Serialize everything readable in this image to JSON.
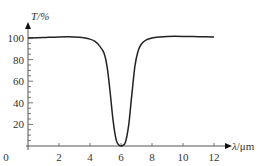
{
  "chart_data": {
    "type": "line",
    "title": "",
    "xlabel": "λ/μm",
    "ylabel": "T/%",
    "xlim": [
      0,
      13
    ],
    "ylim": [
      0,
      110
    ],
    "grid": false,
    "legend": null,
    "x_ticks": [
      0,
      2,
      4,
      6,
      8,
      10,
      12
    ],
    "y_ticks": [
      20,
      40,
      60,
      80,
      100
    ],
    "origin_label": "0",
    "series": [
      {
        "name": "Transmittance",
        "x": [
          0,
          1,
          2,
          3,
          3.5,
          4,
          4.3,
          4.6,
          4.9,
          5.1,
          5.3,
          5.5,
          5.7,
          5.9,
          6.1,
          6.3,
          6.5,
          6.7,
          6.9,
          7.1,
          7.3,
          7.6,
          8,
          8.5,
          9,
          10,
          11,
          12
        ],
        "values": [
          100,
          100.5,
          101,
          101,
          100.5,
          99,
          97,
          93,
          86,
          74,
          50,
          22,
          5,
          0.5,
          0.5,
          4,
          20,
          48,
          74,
          88,
          94,
          98,
          100,
          101,
          101.5,
          101.5,
          101.2,
          101
        ]
      }
    ]
  },
  "axes": {
    "x_label_main": "λ",
    "x_label_unit": "/μm",
    "y_label": "T/%",
    "x_tick_labels": [
      "0",
      "2",
      "4",
      "6",
      "8",
      "10",
      "12"
    ],
    "y_tick_labels": [
      "20",
      "40",
      "60",
      "80",
      "100"
    ]
  },
  "colors": {
    "axis": "#555555",
    "curve": "#222222",
    "text": "#333333"
  }
}
